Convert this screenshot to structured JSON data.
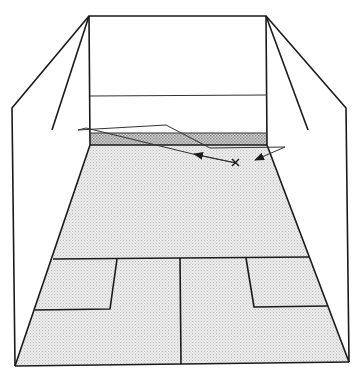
{
  "diagram": {
    "labels": [],
    "colors": {
      "line": "#1a1a1a",
      "floor": "#e4e4e4",
      "tin": "#bdbdbd",
      "background": "#ffffff"
    },
    "ball_position_marker": "x",
    "path_segments": [
      "player to front wall",
      "front wall to side wall",
      "side wall rebound arrow"
    ]
  }
}
